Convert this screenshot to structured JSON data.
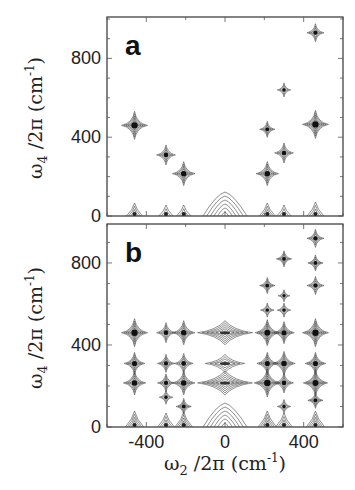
{
  "chart_data": [
    {
      "type": "heatmap",
      "subtype": "2D contour spectrum",
      "panel_label": "a",
      "xlabel": "ω₂/2π (cm⁻¹)",
      "ylabel": "ω₄/2π (cm⁻¹)",
      "xlim": [
        -600,
        600
      ],
      "ylim": [
        0,
        1010
      ],
      "xticks": [
        -400,
        0,
        400
      ],
      "yticks": [
        0,
        400,
        800
      ],
      "ytick_labels": [
        "0",
        "400",
        "800"
      ],
      "peaks": [
        {
          "x": -460,
          "y": 460,
          "intensity": 1.0
        },
        {
          "x": -300,
          "y": 310,
          "intensity": 0.6
        },
        {
          "x": -210,
          "y": 215,
          "intensity": 0.8
        },
        {
          "x": 215,
          "y": 440,
          "intensity": 0.4
        },
        {
          "x": 215,
          "y": 215,
          "intensity": 0.8
        },
        {
          "x": 300,
          "y": 640,
          "intensity": 0.3
        },
        {
          "x": 300,
          "y": 320,
          "intensity": 0.6
        },
        {
          "x": 460,
          "y": 465,
          "intensity": 1.0
        },
        {
          "x": 460,
          "y": 930,
          "intensity": 0.5
        },
        {
          "x": -460,
          "y": 0,
          "intensity": 0.5,
          "edge": true
        },
        {
          "x": -300,
          "y": 0,
          "intensity": 0.3,
          "edge": true
        },
        {
          "x": -210,
          "y": 0,
          "intensity": 0.3,
          "edge": true
        },
        {
          "x": 0,
          "y": 0,
          "intensity": 1.0,
          "edge": true,
          "broad": true
        },
        {
          "x": 215,
          "y": 0,
          "intensity": 0.5,
          "edge": true
        },
        {
          "x": 300,
          "y": 0,
          "intensity": 0.3,
          "edge": true
        },
        {
          "x": 460,
          "y": 0,
          "intensity": 0.6,
          "edge": true
        }
      ]
    },
    {
      "type": "heatmap",
      "subtype": "2D contour spectrum",
      "panel_label": "b",
      "xlabel": "ω₂/2π (cm⁻¹)",
      "ylabel": "ω₄/2π (cm⁻¹)",
      "xlim": [
        -600,
        600
      ],
      "ylim": [
        0,
        990
      ],
      "xticks": [
        -400,
        0,
        400
      ],
      "xtick_labels": [
        "-400",
        "0",
        "400"
      ],
      "yticks": [
        0,
        400,
        800
      ],
      "ytick_labels": [
        "0",
        "400",
        "800"
      ],
      "peaks": [
        {
          "x": -460,
          "y": 460,
          "intensity": 1.0
        },
        {
          "x": -460,
          "y": 310,
          "intensity": 0.7
        },
        {
          "x": -460,
          "y": 215,
          "intensity": 0.8
        },
        {
          "x": -300,
          "y": 460,
          "intensity": 0.6
        },
        {
          "x": -300,
          "y": 310,
          "intensity": 0.5
        },
        {
          "x": -300,
          "y": 215,
          "intensity": 0.5
        },
        {
          "x": -300,
          "y": 145,
          "intensity": 0.3
        },
        {
          "x": -210,
          "y": 460,
          "intensity": 0.8
        },
        {
          "x": -210,
          "y": 310,
          "intensity": 0.6
        },
        {
          "x": -210,
          "y": 215,
          "intensity": 0.8
        },
        {
          "x": -210,
          "y": 100,
          "intensity": 0.4
        },
        {
          "x": 0,
          "y": 460,
          "intensity": 0.9,
          "broad": true
        },
        {
          "x": 0,
          "y": 310,
          "intensity": 0.6,
          "broad": true
        },
        {
          "x": 0,
          "y": 215,
          "intensity": 0.9,
          "broad": true
        },
        {
          "x": 215,
          "y": 690,
          "intensity": 0.4
        },
        {
          "x": 215,
          "y": 570,
          "intensity": 0.3
        },
        {
          "x": 215,
          "y": 460,
          "intensity": 0.9
        },
        {
          "x": 215,
          "y": 310,
          "intensity": 0.7
        },
        {
          "x": 215,
          "y": 215,
          "intensity": 1.0
        },
        {
          "x": 300,
          "y": 820,
          "intensity": 0.4
        },
        {
          "x": 300,
          "y": 640,
          "intensity": 0.2
        },
        {
          "x": 300,
          "y": 570,
          "intensity": 0.3
        },
        {
          "x": 300,
          "y": 460,
          "intensity": 0.7
        },
        {
          "x": 300,
          "y": 310,
          "intensity": 0.8
        },
        {
          "x": 300,
          "y": 215,
          "intensity": 0.6
        },
        {
          "x": 300,
          "y": 100,
          "intensity": 0.3
        },
        {
          "x": 460,
          "y": 920,
          "intensity": 0.5
        },
        {
          "x": 460,
          "y": 800,
          "intensity": 0.4
        },
        {
          "x": 460,
          "y": 690,
          "intensity": 0.5
        },
        {
          "x": 460,
          "y": 460,
          "intensity": 1.0
        },
        {
          "x": 460,
          "y": 310,
          "intensity": 0.7
        },
        {
          "x": 460,
          "y": 215,
          "intensity": 0.9
        },
        {
          "x": 460,
          "y": 130,
          "intensity": 0.4
        },
        {
          "x": -460,
          "y": 0,
          "intensity": 0.8,
          "edge": true
        },
        {
          "x": -300,
          "y": 0,
          "intensity": 0.6,
          "edge": true
        },
        {
          "x": -210,
          "y": 0,
          "intensity": 0.7,
          "edge": true
        },
        {
          "x": 0,
          "y": 0,
          "intensity": 1.0,
          "edge": true,
          "broad": true
        },
        {
          "x": 215,
          "y": 0,
          "intensity": 0.8,
          "edge": true
        },
        {
          "x": 300,
          "y": 0,
          "intensity": 0.6,
          "edge": true
        },
        {
          "x": 460,
          "y": 0,
          "intensity": 0.8,
          "edge": true
        }
      ]
    }
  ],
  "shared_xlabel": {
    "symbol": "ω",
    "sub": "2",
    "rest": " /2π (cm",
    "sup": "-1",
    "close": ")"
  },
  "shared_ylabel": {
    "symbol": "ω",
    "sub": "4",
    "rest": " /2π (cm",
    "sup": "-1",
    "close": ")"
  }
}
